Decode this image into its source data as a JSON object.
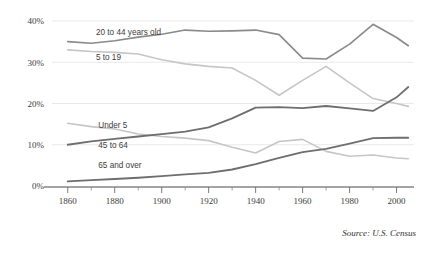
{
  "chart_data": {
    "type": "line",
    "title": "",
    "subtitle": "",
    "xlabel": "",
    "ylabel": "",
    "xlim": [
      1855,
      2007
    ],
    "ylim": [
      0,
      42
    ],
    "grid": true,
    "legend_position": "inline-labels",
    "source_note": "Source: U.S. Census",
    "y_ticks": [
      "0%",
      "10%",
      "20%",
      "30%",
      "40%"
    ],
    "y_tick_values": [
      0,
      10,
      20,
      30,
      40
    ],
    "x_ticks": [
      "1860",
      "1880",
      "1900",
      "1920",
      "1940",
      "1960",
      "1980",
      "2000"
    ],
    "x_tick_values": [
      1860,
      1880,
      1900,
      1920,
      1940,
      1960,
      1980,
      2000
    ],
    "x_minor_ticks": [
      1870,
      1890,
      1910,
      1930,
      1950,
      1970,
      1990
    ],
    "x": [
      1860,
      1870,
      1880,
      1890,
      1900,
      1910,
      1920,
      1930,
      1940,
      1950,
      1960,
      1970,
      1980,
      1990,
      2000,
      2005
    ],
    "series": [
      {
        "name": "20 to 44 years old",
        "color": "#8a8a8a",
        "width": 1.6,
        "label_x": 1872,
        "label_y": 36.6,
        "values": [
          35.0,
          34.6,
          35.2,
          36.1,
          36.8,
          37.8,
          37.5,
          37.6,
          37.8,
          36.7,
          31.0,
          30.8,
          34.4,
          39.2,
          36.0,
          34.0
        ]
      },
      {
        "name": "5 to 19",
        "color": "#c6c6c6",
        "width": 1.6,
        "label_x": 1872,
        "label_y": 30.5,
        "values": [
          33.0,
          32.6,
          32.4,
          32.0,
          30.6,
          29.6,
          29.0,
          28.6,
          25.6,
          22.0,
          25.6,
          29.0,
          25.0,
          21.2,
          20.0,
          19.3
        ]
      },
      {
        "name": "Under 5",
        "color": "#c6c6c6",
        "width": 1.6,
        "label_x": 1873,
        "label_y": 14.0,
        "values": [
          15.2,
          14.4,
          13.8,
          12.6,
          12.0,
          11.6,
          11.0,
          9.4,
          8.0,
          10.8,
          11.3,
          8.4,
          7.2,
          7.5,
          6.8,
          6.6
        ]
      },
      {
        "name": "45 to 64",
        "color": "#6e6e6e",
        "width": 1.8,
        "label_x": 1873,
        "label_y": 9.2,
        "values": [
          10.0,
          10.8,
          11.4,
          12.0,
          12.6,
          13.2,
          14.2,
          16.4,
          19.0,
          19.1,
          18.9,
          19.4,
          18.8,
          18.2,
          21.5,
          24.0
        ]
      },
      {
        "name": "65 and over",
        "color": "#6e6e6e",
        "width": 1.8,
        "label_x": 1873,
        "label_y": 4.4,
        "values": [
          1.1,
          1.4,
          1.7,
          2.0,
          2.4,
          2.8,
          3.2,
          4.0,
          5.3,
          6.8,
          8.2,
          9.0,
          10.3,
          11.6,
          11.7,
          11.7
        ]
      }
    ]
  }
}
